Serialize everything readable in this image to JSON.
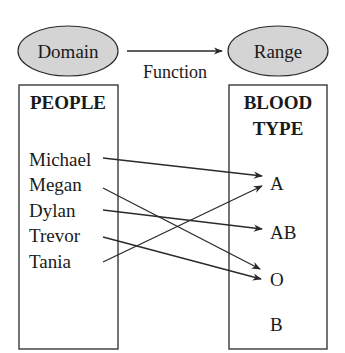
{
  "diagram": {
    "domain_label": "Domain",
    "range_label": "Range",
    "function_label": "Function",
    "colors": {
      "ellipse_fill": "#d4d4d4",
      "stroke": "#2a2a2a",
      "text": "#1a1a1a",
      "background": "#ffffff"
    },
    "domain_set": {
      "heading": "PEOPLE",
      "items": [
        "Michael",
        "Megan",
        "Dylan",
        "Trevor",
        "Tania"
      ]
    },
    "range_set": {
      "heading_line1": "BLOOD",
      "heading_line2": "TYPE",
      "items": [
        "A",
        "AB",
        "O",
        "B"
      ]
    },
    "mappings": [
      {
        "from": "Michael",
        "to": "A"
      },
      {
        "from": "Megan",
        "to": "O"
      },
      {
        "from": "Dylan",
        "to": "AB"
      },
      {
        "from": "Trevor",
        "to": "O"
      },
      {
        "from": "Tania",
        "to": "A"
      }
    ]
  }
}
